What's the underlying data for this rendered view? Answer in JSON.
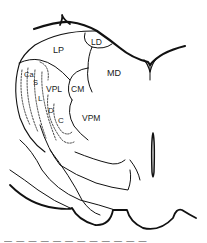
{
  "figure": {
    "type": "anatomical-line-drawing",
    "line_color": "#111111",
    "background": "#ffffff"
  },
  "labels": {
    "LP": "LP",
    "LD": "LD",
    "MD": "MD",
    "CM": "CM",
    "VPL": "VPL",
    "VPM": "VPM",
    "Ca": "Ca",
    "S": "S",
    "L": "L",
    "D": "D",
    "C": "C"
  },
  "caption": {
    "text": "— — — — — — — — — — — —"
  }
}
